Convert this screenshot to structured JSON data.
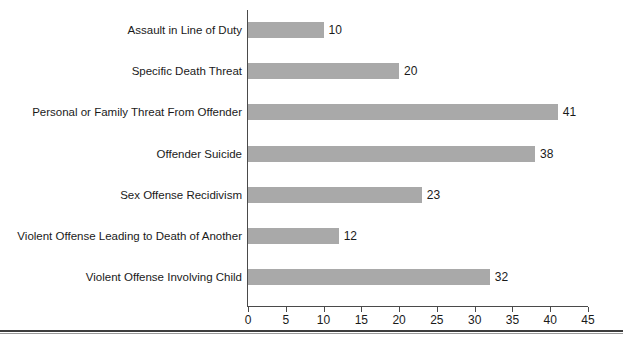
{
  "chart_data": {
    "type": "bar",
    "orientation": "horizontal",
    "title": "",
    "subtitle": "",
    "xlabel": "",
    "ylabel": "",
    "xlim": [
      0,
      45
    ],
    "xticks": [
      0,
      5,
      10,
      15,
      20,
      25,
      30,
      35,
      40,
      45
    ],
    "grid": false,
    "legend": false,
    "bar_color": "#a9a9a9",
    "axis_color": "#4a4a4a",
    "text_color": "#1a1a1a",
    "data_labels": true,
    "categories": [
      "Assault in Line of Duty",
      "Specific Death Threat",
      "Personal or Family Threat From Offender",
      "Offender Suicide",
      "Sex Offense Recidivism",
      "Violent Offense Leading to Death of Another",
      "Violent Offense Involving Child"
    ],
    "values": [
      10,
      20,
      41,
      38,
      23,
      12,
      32
    ],
    "points": [
      {
        "category": "Assault in Line of Duty",
        "value": 10,
        "label": "10"
      },
      {
        "category": "Specific Death Threat",
        "value": 20,
        "label": "20"
      },
      {
        "category": "Personal or Family Threat From Offender",
        "value": 41,
        "label": "41"
      },
      {
        "category": "Offender Suicide",
        "value": 38,
        "label": "38"
      },
      {
        "category": "Sex Offense Recidivism",
        "value": 23,
        "label": "23"
      },
      {
        "category": "Violent Offense Leading to Death of Another",
        "value": 12,
        "label": "12"
      },
      {
        "category": "Violent Offense Involving Child",
        "value": 32,
        "label": "32"
      }
    ],
    "xtick_labels": [
      "0",
      "5",
      "10",
      "15",
      "20",
      "25",
      "30",
      "35",
      "40",
      "45"
    ]
  }
}
